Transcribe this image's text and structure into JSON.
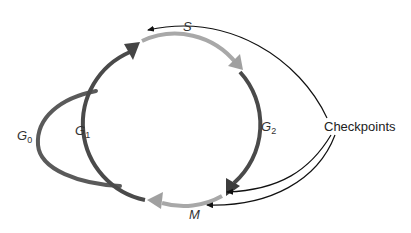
{
  "diagram": {
    "phases": [
      {
        "id": "G0",
        "label": "G",
        "sub": "0",
        "color": "#5a5a5a"
      },
      {
        "id": "G1",
        "label": "G",
        "sub": "1",
        "color": "#4a4a4a"
      },
      {
        "id": "S",
        "label": "S",
        "sub": "",
        "color": "#a8a8a8"
      },
      {
        "id": "G2",
        "label": "G",
        "sub": "2",
        "color": "#4a4a4a"
      },
      {
        "id": "M",
        "label": "M",
        "sub": "",
        "color": "#a8a8a8"
      }
    ],
    "checkpoints_label": "Checkpoints",
    "checkpoint_targets": [
      "G1/S boundary",
      "G2/M boundary",
      "M (metaphase)"
    ],
    "colors": {
      "dark_arc": "#4a4a4a",
      "light_arc": "#a8a8a8",
      "pointer": "#111111"
    }
  }
}
